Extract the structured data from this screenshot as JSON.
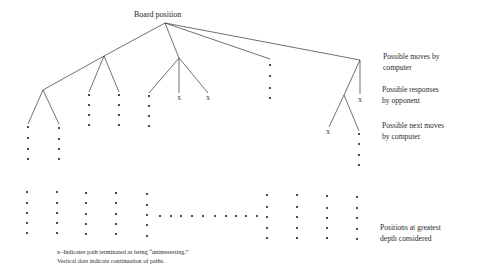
{
  "root": {
    "label": "Board position"
  },
  "levels": [
    {
      "line1": "Possible moves by",
      "line2": "computer"
    },
    {
      "line1": "Possible responses",
      "line2": "by opponent"
    },
    {
      "line1": "Possible next moves",
      "line2": "by computer"
    },
    {
      "line1": "Positions at greatest",
      "line2": "depth considered"
    }
  ],
  "legend": {
    "line1": "x–Indicates path terminated as being “uninteresting.”",
    "line2": "Vertical dots indicate continuation of paths."
  },
  "terminator_symbol": "x",
  "colors": {
    "ink": "#222222",
    "background": "#ffffff"
  }
}
